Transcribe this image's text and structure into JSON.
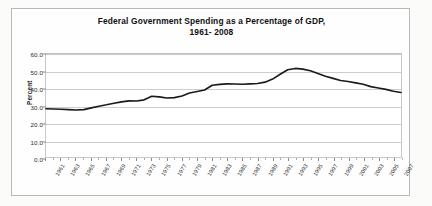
{
  "chart_data": {
    "type": "line",
    "title": "Federal Government Spending as a Percentage of GDP,",
    "subtitle": "1961- 2008",
    "xlabel": "",
    "ylabel": "Percent",
    "ylim": [
      0.0,
      60.0
    ],
    "yticks": [
      "0.0",
      "10.0",
      "20.0",
      "30.0",
      "40.0",
      "50.0",
      "60.0"
    ],
    "ytick_values": [
      0.0,
      10.0,
      20.0,
      30.0,
      40.0,
      50.0,
      60.0
    ],
    "grid": "horizontal",
    "legend": "none",
    "xtick_labels": [
      "1961",
      "1963",
      "1965",
      "1967",
      "1969",
      "1971",
      "1973",
      "1975",
      "1977",
      "1979",
      "1981",
      "1983",
      "1985",
      "1987",
      "1989",
      "1991",
      "1993",
      "1995",
      "1997",
      "1999",
      "2001",
      "2003",
      "2005",
      "2007"
    ],
    "line_color": "#1a1a1a",
    "categories": [
      1961,
      1962,
      1963,
      1964,
      1965,
      1966,
      1967,
      1968,
      1969,
      1970,
      1971,
      1972,
      1973,
      1974,
      1975,
      1976,
      1977,
      1978,
      1979,
      1980,
      1981,
      1982,
      1983,
      1984,
      1985,
      1986,
      1987,
      1988,
      1989,
      1990,
      1991,
      1992,
      1993,
      1994,
      1995,
      1996,
      1997,
      1998,
      1999,
      2000,
      2001,
      2002,
      2003,
      2004,
      2005,
      2006,
      2007,
      2008
    ],
    "values": [
      28.1,
      28.0,
      27.8,
      27.6,
      27.4,
      27.6,
      28.6,
      29.6,
      30.4,
      31.3,
      32.1,
      32.7,
      32.6,
      33.3,
      35.4,
      35.0,
      34.4,
      34.6,
      35.5,
      37.3,
      38.2,
      39.0,
      41.8,
      42.3,
      42.6,
      42.5,
      42.4,
      42.6,
      42.8,
      43.6,
      45.4,
      48.2,
      50.8,
      51.6,
      51.2,
      50.2,
      48.6,
      47.0,
      45.8,
      44.6,
      44.0,
      43.2,
      42.4,
      41.0,
      40.2,
      39.4,
      38.3,
      37.6
    ]
  }
}
